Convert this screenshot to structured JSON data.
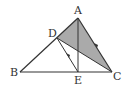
{
  "diagram": {
    "points": {
      "A": {
        "label": "A",
        "x": 78,
        "y": 18
      },
      "B": {
        "label": "B",
        "x": 20,
        "y": 72
      },
      "C": {
        "label": "C",
        "x": 112,
        "y": 72
      },
      "D": {
        "label": "D",
        "x": 57,
        "y": 38
      },
      "E": {
        "label": "E",
        "x": 78,
        "y": 72
      }
    },
    "shaded_region": "ADC",
    "colors": {
      "stroke": "#333333",
      "shade": "#a9a9a9"
    }
  }
}
